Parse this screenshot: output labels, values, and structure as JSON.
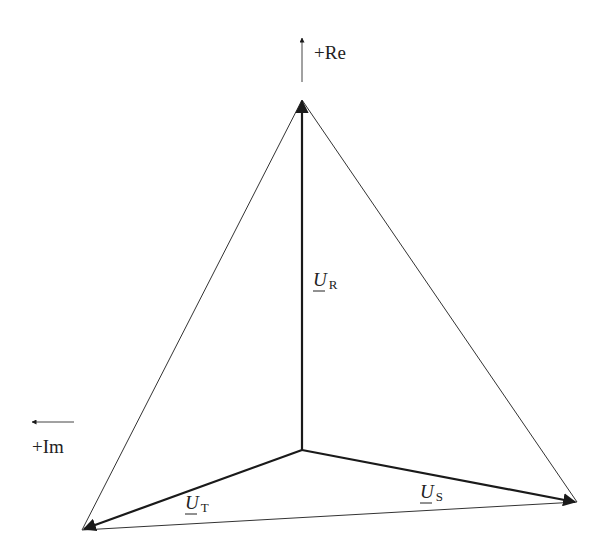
{
  "diagram": {
    "type": "phasor-diagram",
    "axes": {
      "real": {
        "label": "+Re",
        "direction": "up"
      },
      "imag": {
        "label": "+Im",
        "direction": "left"
      }
    },
    "phasors": [
      {
        "name": "U",
        "subscript": "R",
        "underlined": true
      },
      {
        "name": "U",
        "subscript": "S",
        "underlined": true
      },
      {
        "name": "U",
        "subscript": "T",
        "underlined": true
      }
    ],
    "colors": {
      "line": "#1a1a1a",
      "thin_line": "#333333",
      "background": "#ffffff"
    }
  }
}
